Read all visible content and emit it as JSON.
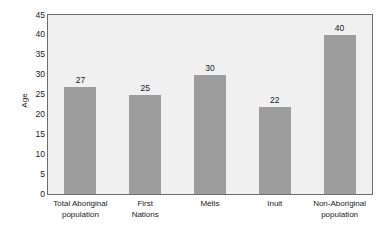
{
  "chart_data": {
    "type": "bar",
    "title": "",
    "subtitle": "",
    "xlabel": "",
    "ylabel": "Age",
    "ylim": [
      0,
      45
    ],
    "ytick_step": 5,
    "yticks": [
      "45",
      "40",
      "35",
      "30",
      "25",
      "20",
      "15",
      "10",
      "5",
      "0"
    ],
    "grid": false,
    "legend": false,
    "categories": [
      "Total Aboriginal population",
      "First Nations",
      "Métis",
      "Inuit",
      "Non-Aboriginal population"
    ],
    "category_lines": [
      [
        "Total Aboriginal",
        "population"
      ],
      [
        "First",
        "Nations"
      ],
      [
        "Métis"
      ],
      [
        "Inuit"
      ],
      [
        "Non-Aboriginal",
        "population"
      ]
    ],
    "values": [
      27,
      25,
      30,
      22,
      40
    ],
    "value_labels": [
      "27",
      "25",
      "30",
      "22",
      "40"
    ],
    "colors": {
      "bar": "#9d9d9d",
      "plot_background": "#f0f0f0",
      "page_background": "#ffffff",
      "axis_line": "#6e6e6e",
      "text": "#1a1a1a"
    }
  }
}
